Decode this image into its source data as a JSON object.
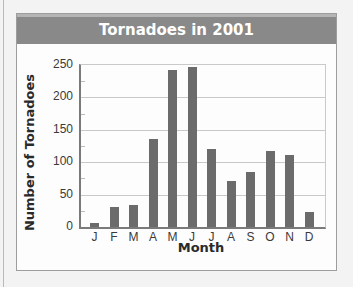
{
  "chart_data": {
    "type": "bar",
    "title": "Tornadoes in 2001",
    "xlabel": "Month",
    "ylabel": "Number of Tornadoes",
    "categories": [
      "J",
      "F",
      "M",
      "A",
      "M",
      "J",
      "J",
      "A",
      "S",
      "O",
      "N",
      "D"
    ],
    "values": [
      6,
      31,
      34,
      136,
      242,
      247,
      120,
      71,
      85,
      117,
      111,
      23
    ],
    "ylim": [
      0,
      250
    ],
    "yticks": [
      0,
      50,
      100,
      150,
      200,
      250
    ],
    "grid": true,
    "legend": null
  },
  "colors": {
    "title_bar": "#898989",
    "bar": "#6b6b6b",
    "grid": "#c8c8c8"
  }
}
